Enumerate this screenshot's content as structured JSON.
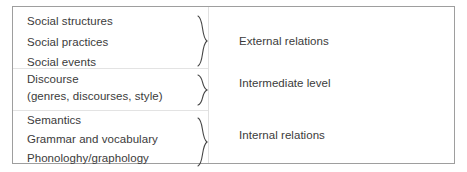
{
  "figure": {
    "type": "three-level-framework-diagram",
    "border_color": "#9e9e9e",
    "text_color": "#3b3b3b",
    "background": "#ffffff",
    "groups": [
      {
        "relation_label": "External relations",
        "brace_icon": "curly-brace-icon",
        "items": [
          {
            "text": "Social structures"
          },
          {
            "text": "Social practices"
          },
          {
            "text": "Social events"
          }
        ]
      },
      {
        "relation_label": "Intermediate level",
        "brace_icon": "curly-brace-icon",
        "items": [
          {
            "text": "Discourse"
          },
          {
            "text": "(genres, discourses, style)"
          }
        ]
      },
      {
        "relation_label": "Internal relations",
        "brace_icon": "curly-brace-icon",
        "items": [
          {
            "text": "Semantics"
          },
          {
            "text": "Grammar and vocabulary"
          },
          {
            "text": "Phonologhy/graphology"
          }
        ]
      }
    ]
  }
}
